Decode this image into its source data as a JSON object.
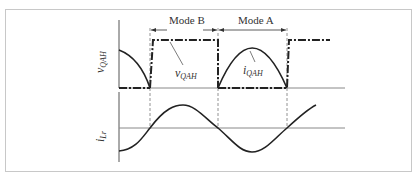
{
  "diagram": {
    "mode_labels": {
      "mode_b": "Mode B",
      "mode_a": "Mode A"
    },
    "upper_plot": {
      "y_axis_label": {
        "main": "v",
        "sub": "QAH"
      },
      "annotations": [
        {
          "main": "v",
          "sub": "QAH"
        },
        {
          "main": "i",
          "sub": "QAH"
        }
      ]
    },
    "lower_plot": {
      "y_axis_label": {
        "main": "i",
        "sub": "Lr"
      }
    },
    "colors": {
      "trace": "#222222",
      "axis": "#555555",
      "grid": "#888888",
      "frame": "#c8c8c8"
    }
  }
}
